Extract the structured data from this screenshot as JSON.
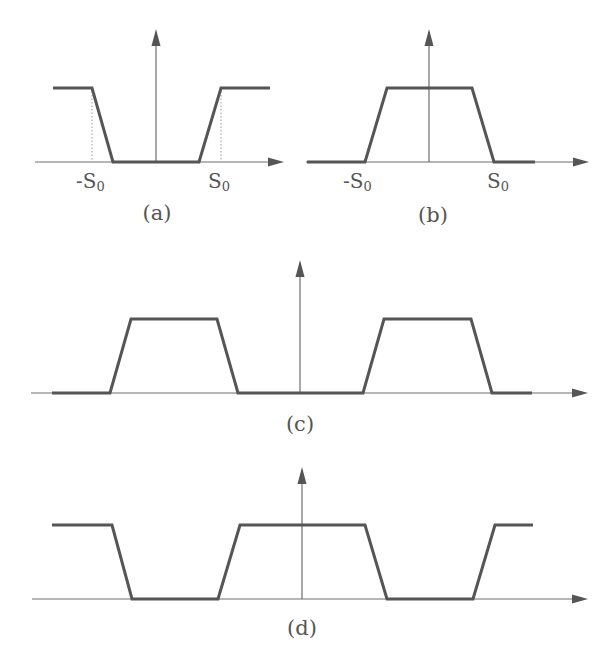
{
  "figure": {
    "colors": {
      "curve": "#555555",
      "axis": "#6e6e6e",
      "guide": "#9a9a9a",
      "text": "#555555",
      "background": "#ffffff"
    },
    "panels": [
      {
        "id": "a",
        "caption": "(a)",
        "caption_pos": [
          157,
          220
        ],
        "axis": {
          "x_start": 35,
          "x_end": 284,
          "y": 162,
          "v_x": 156,
          "v_top": 29
        },
        "curve": [
          [
            53,
            88
          ],
          [
            92,
            88
          ],
          [
            113,
            162
          ],
          [
            199,
            162
          ],
          [
            221,
            88
          ],
          [
            270,
            88
          ]
        ],
        "guides": [
          [
            92,
            88,
            92,
            162
          ],
          [
            221,
            88,
            221,
            162
          ]
        ],
        "ticks": [
          {
            "main": "-S",
            "sub": "0",
            "x": 76,
            "y": 188
          },
          {
            "main": "S",
            "sub": "0",
            "x": 208,
            "y": 188
          }
        ]
      },
      {
        "id": "b",
        "caption": "(b)",
        "caption_pos": [
          433,
          222
        ],
        "axis": {
          "x_start": 306,
          "x_end": 589,
          "y": 162,
          "v_x": 429,
          "v_top": 29
        },
        "curve": [
          [
            307,
            162
          ],
          [
            365,
            162
          ],
          [
            387,
            88
          ],
          [
            472,
            88
          ],
          [
            494,
            162
          ],
          [
            535,
            162
          ]
        ],
        "guides": [],
        "ticks": [
          {
            "main": "-S",
            "sub": "0",
            "x": 343,
            "y": 188
          },
          {
            "main": "S",
            "sub": "0",
            "x": 487,
            "y": 188
          }
        ]
      },
      {
        "id": "c",
        "caption": "(c)",
        "caption_pos": [
          300,
          431
        ],
        "axis": {
          "x_start": 31,
          "x_end": 588,
          "y": 393,
          "v_x": 300,
          "v_top": 260
        },
        "curve": [
          [
            52,
            393
          ],
          [
            110,
            393
          ],
          [
            131,
            319
          ],
          [
            217,
            319
          ],
          [
            238,
            393
          ],
          [
            363,
            393
          ],
          [
            384,
            319
          ],
          [
            471,
            319
          ],
          [
            492,
            393
          ],
          [
            532,
            393
          ]
        ],
        "guides": [],
        "ticks": []
      },
      {
        "id": "d",
        "caption": "(d)",
        "caption_pos": [
          302,
          635
        ],
        "axis": {
          "x_start": 32,
          "x_end": 588,
          "y": 599,
          "v_x": 302,
          "v_top": 467
        },
        "curve": [
          [
            52,
            525
          ],
          [
            112,
            525
          ],
          [
            132,
            599
          ],
          [
            218,
            599
          ],
          [
            240,
            525
          ],
          [
            365,
            525
          ],
          [
            387,
            599
          ],
          [
            473,
            599
          ],
          [
            495,
            525
          ],
          [
            533,
            525
          ]
        ],
        "guides": [],
        "ticks": []
      }
    ]
  }
}
